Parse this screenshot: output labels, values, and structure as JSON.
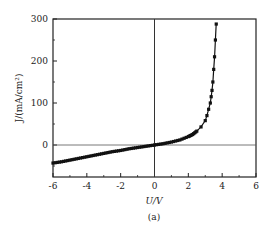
{
  "chart_data": {
    "type": "line",
    "title": "",
    "caption": "(a)",
    "xlabel": "U/V",
    "ylabel": "J/(mA/cm²)",
    "xlim": [
      -6,
      6
    ],
    "ylim": [
      -75,
      300
    ],
    "xticks": [
      -6,
      -4,
      -2,
      0,
      2,
      4,
      6
    ],
    "yticks": [
      0,
      100,
      200,
      300
    ],
    "grid": false,
    "legend": null,
    "reference_lines": {
      "x": 0,
      "y": 0
    },
    "series": [
      {
        "name": "J-U curve",
        "marker": "square",
        "color": "#111111",
        "x": [
          -6,
          -5.5,
          -5,
          -4.5,
          -4,
          -3.5,
          -3,
          -2.5,
          -2,
          -1.5,
          -1,
          -0.5,
          0,
          0.5,
          1,
          1.5,
          2,
          2.25,
          2.5,
          2.75,
          3,
          3.1,
          3.2,
          3.3,
          3.35,
          3.4,
          3.45,
          3.5,
          3.55,
          3.6,
          3.65
        ],
        "y": [
          -43,
          -40,
          -36,
          -32,
          -28,
          -24,
          -20,
          -16,
          -13,
          -9,
          -6,
          -3,
          0,
          3,
          7,
          12,
          20,
          25,
          33,
          43,
          58,
          70,
          85,
          100,
          115,
          130,
          150,
          180,
          210,
          250,
          288
        ]
      }
    ]
  }
}
